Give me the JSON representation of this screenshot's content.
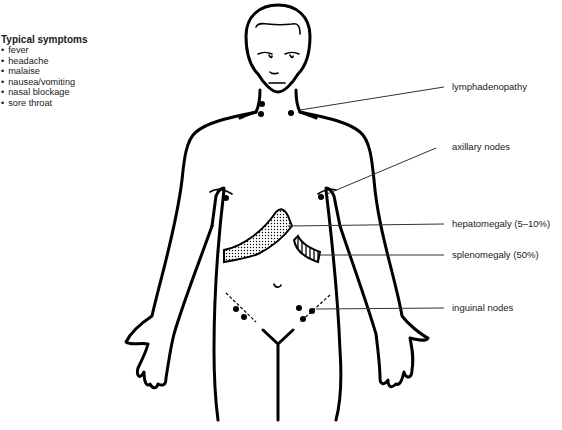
{
  "symptoms": {
    "title": "Typical symptoms",
    "items": [
      "fever",
      "headache",
      "malaise",
      "nausea/vomiting",
      "nasal blockage",
      "sore throat"
    ]
  },
  "labels": {
    "lymphadenopathy": "lymphadenopathy",
    "axillary_nodes": "axillary nodes",
    "hepatomegaly": "hepatomegaly (5–10%)",
    "splenomegaly": "splenomegaly (50%)",
    "inguinal_nodes": "inguinal nodes"
  }
}
